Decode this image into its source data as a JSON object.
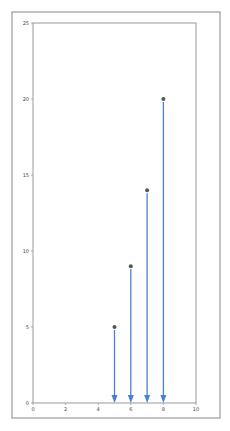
{
  "chart_data": {
    "type": "scatter",
    "title": "",
    "xlabel": "",
    "ylabel": "",
    "xlim": [
      0,
      10
    ],
    "ylim": [
      0,
      25
    ],
    "xticks": [
      0,
      2,
      4,
      6,
      8,
      10
    ],
    "yticks": [
      0,
      5,
      10,
      15,
      20,
      25
    ],
    "grid": false,
    "legend": null,
    "points": [
      {
        "x": 5,
        "y": 5
      },
      {
        "x": 6,
        "y": 9
      },
      {
        "x": 7,
        "y": 14
      },
      {
        "x": 8,
        "y": 20
      }
    ],
    "annotations": "Each point has a downward arrow drawn from the point to the x-axis (y=0).",
    "colors": {
      "arrow": "#4a7fd4",
      "marker": "#555555",
      "axes": "#999999",
      "frame": "#888888"
    }
  }
}
